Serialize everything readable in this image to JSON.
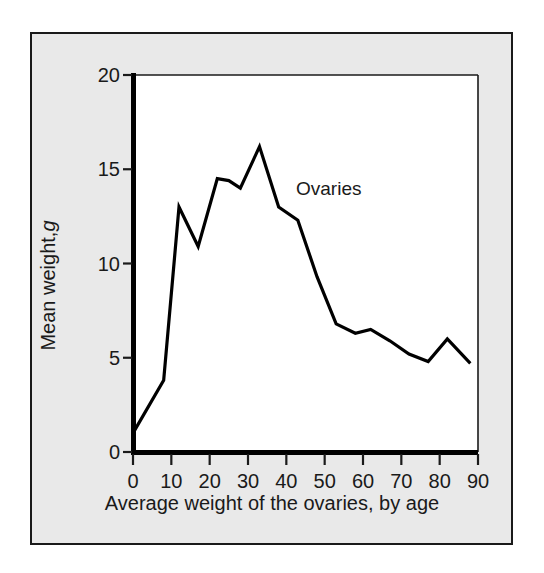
{
  "chart_data": {
    "type": "line",
    "title": "",
    "subtitle": "",
    "xlabel": "Average weight of the ovaries, by age",
    "ylabel": "Mean weight, g",
    "ylabel_plain": "Mean weight,",
    "ylabel_italic": "g",
    "annotation": "Ovaries",
    "series_name": "Ovaries",
    "grid": false,
    "legend_position": "inline-annotation",
    "xlim": [
      0,
      90
    ],
    "ylim": [
      0,
      20
    ],
    "xticks": [
      0,
      10,
      20,
      30,
      40,
      50,
      60,
      70,
      80,
      90
    ],
    "yticks": [
      0,
      5,
      10,
      15,
      20
    ],
    "xtick_labels": [
      "0",
      "10",
      "20",
      "30",
      "40",
      "50",
      "60",
      "70",
      "80",
      "90"
    ],
    "ytick_labels": [
      "0",
      "5",
      "10",
      "15",
      "20"
    ],
    "x": [
      0,
      8,
      12,
      17,
      22,
      25,
      28,
      33,
      38,
      43,
      48,
      53,
      58,
      62,
      67,
      72,
      77,
      82,
      88
    ],
    "values": [
      1.0,
      3.8,
      13.0,
      10.9,
      14.5,
      14.4,
      14.0,
      16.2,
      13.0,
      12.3,
      9.3,
      6.8,
      6.3,
      6.5,
      5.9,
      5.2,
      4.8,
      6.0,
      4.7
    ],
    "series": [
      {
        "name": "Ovaries",
        "x": [
          0,
          8,
          12,
          17,
          22,
          25,
          28,
          33,
          38,
          43,
          48,
          53,
          58,
          62,
          67,
          72,
          77,
          82,
          88
        ],
        "values": [
          1.0,
          3.8,
          13.0,
          10.9,
          14.5,
          14.4,
          14.0,
          16.2,
          13.0,
          12.3,
          9.3,
          6.8,
          6.3,
          6.5,
          5.9,
          5.2,
          4.8,
          6.0,
          4.7
        ],
        "color": "#000000"
      }
    ],
    "colors": {
      "line": "#000000",
      "axis": "#000000",
      "plot_background": "#ffffff",
      "figure_background": "#e9e9e9",
      "frame_border": "#1a1a1a",
      "text": "#1a1a1a"
    }
  }
}
